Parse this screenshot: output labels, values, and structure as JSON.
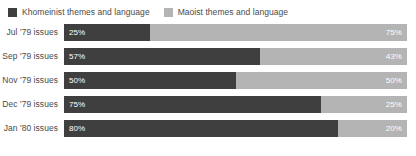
{
  "legend": {
    "position": "top-left",
    "entries": [
      {
        "label": "Khomeinist themes and language",
        "color": "#3f3f3f",
        "swatch_name": "legend-swatch-khomeinist"
      },
      {
        "label": "Maoist themes and language",
        "color": "#b4b4b4",
        "swatch_name": "legend-swatch-maoist"
      }
    ]
  },
  "chart_data": {
    "type": "bar",
    "orientation": "horizontal",
    "stacked": true,
    "normalized": "100%",
    "title": "",
    "subtitle": "",
    "xlabel": "",
    "ylabel": "",
    "xlim": [
      0,
      100
    ],
    "grid": false,
    "legend_position": "top-left",
    "value_suffix": "%",
    "categories": [
      "Jul '79 issues",
      "Sep '79 issues",
      "Nov '79 issues",
      "Dec '79 issues",
      "Jan '80 issues"
    ],
    "series": [
      {
        "name": "Khomeinist themes and language",
        "color": "#3f3f3f",
        "values": [
          25,
          57,
          50,
          75,
          80
        ],
        "labels": [
          "25%",
          "57%",
          "50%",
          "75%",
          "80%"
        ]
      },
      {
        "name": "Maoist themes and language",
        "color": "#b4b4b4",
        "values": [
          75,
          43,
          50,
          25,
          20
        ],
        "labels": [
          "75%",
          "43%",
          "50%",
          "25%",
          "20%"
        ]
      }
    ]
  },
  "rows": [
    {
      "label": "Jul '79 issues",
      "primary": {
        "value": 25,
        "text": "25%",
        "color": "#3f3f3f"
      },
      "secondary": {
        "value": 75,
        "text": "75%",
        "color": "#b4b4b4"
      }
    },
    {
      "label": "Sep '79 issues",
      "primary": {
        "value": 57,
        "text": "57%",
        "color": "#3f3f3f"
      },
      "secondary": {
        "value": 43,
        "text": "43%",
        "color": "#b4b4b4"
      }
    },
    {
      "label": "Nov '79 issues",
      "primary": {
        "value": 50,
        "text": "50%",
        "color": "#3f3f3f"
      },
      "secondary": {
        "value": 50,
        "text": "50%",
        "color": "#b4b4b4"
      }
    },
    {
      "label": "Dec '79 issues",
      "primary": {
        "value": 75,
        "text": "75%",
        "color": "#3f3f3f"
      },
      "secondary": {
        "value": 25,
        "text": "25%",
        "color": "#b4b4b4"
      }
    },
    {
      "label": "Jan '80 issues",
      "primary": {
        "value": 80,
        "text": "80%",
        "color": "#3f3f3f"
      },
      "secondary": {
        "value": 20,
        "text": "20%",
        "color": "#b4b4b4"
      }
    }
  ]
}
